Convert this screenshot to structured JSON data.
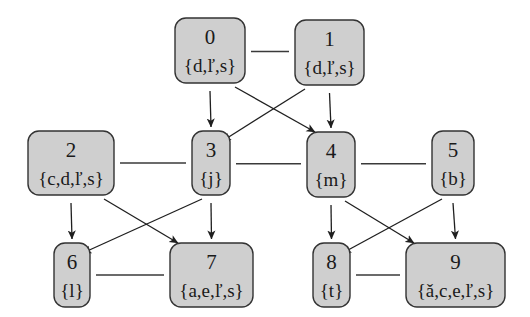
{
  "diagram": {
    "type": "graph",
    "nodes": [
      {
        "id": "0",
        "label": "{d,ľ,s}",
        "row": 0
      },
      {
        "id": "1",
        "label": "{d,ľ,s}",
        "row": 0
      },
      {
        "id": "2",
        "label": "{c,d,ľ,s}",
        "row": 1
      },
      {
        "id": "3",
        "label": "{j}",
        "row": 1
      },
      {
        "id": "4",
        "label": "{m}",
        "row": 1
      },
      {
        "id": "5",
        "label": "{b}",
        "row": 1
      },
      {
        "id": "6",
        "label": "{l}",
        "row": 2
      },
      {
        "id": "7",
        "label": "{a,e,ľ,s}",
        "row": 2
      },
      {
        "id": "8",
        "label": "{t}",
        "row": 2
      },
      {
        "id": "9",
        "label": "{ǎ,c,e,ľ,s}",
        "row": 2
      }
    ],
    "undirected_edges": [
      [
        "0",
        "1"
      ],
      [
        "2",
        "3"
      ],
      [
        "3",
        "4"
      ],
      [
        "4",
        "5"
      ],
      [
        "6",
        "7"
      ],
      [
        "8",
        "9"
      ]
    ],
    "directed_edges": [
      [
        "0",
        "3"
      ],
      [
        "0",
        "4"
      ],
      [
        "1",
        "3"
      ],
      [
        "1",
        "4"
      ],
      [
        "2",
        "6"
      ],
      [
        "2",
        "7"
      ],
      [
        "3",
        "6"
      ],
      [
        "3",
        "7"
      ],
      [
        "4",
        "8"
      ],
      [
        "4",
        "9"
      ],
      [
        "5",
        "8"
      ],
      [
        "5",
        "9"
      ]
    ]
  }
}
